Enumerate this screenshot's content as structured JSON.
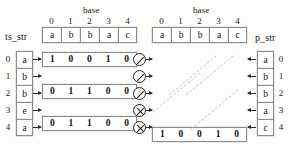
{
  "diagram": {
    "left_panel": {
      "base_label": "base",
      "base_indices": [
        "0",
        "1",
        "2",
        "3",
        "4"
      ],
      "base_letters": [
        "a",
        "b",
        "b",
        "a",
        "c"
      ],
      "string_label": "ts_str",
      "row_indices": [
        "0",
        "1",
        "2",
        "3",
        "4"
      ],
      "string_letters": [
        "a",
        "b",
        "b",
        "e",
        "a"
      ],
      "bit_rows": [
        [
          "1",
          "0",
          "0",
          "1",
          "0"
        ],
        [
          "0",
          "1",
          "1",
          "0",
          "0"
        ],
        [
          "0",
          "1",
          "1",
          "0",
          "0"
        ],
        [
          "0",
          "0",
          "0",
          "0",
          "0"
        ],
        [
          "1",
          "0",
          "0",
          "1",
          "0"
        ]
      ]
    },
    "operators": [
      {
        "name": "slash-circle",
        "glyph": "/"
      },
      {
        "name": "slash-circle",
        "glyph": "/"
      },
      {
        "name": "slash-circle",
        "glyph": "/"
      },
      {
        "name": "x-circle",
        "glyph": "X"
      },
      {
        "name": "x-circle",
        "glyph": "X"
      }
    ],
    "right_panel": {
      "base_label": "base",
      "base_indices": [
        "0",
        "1",
        "2",
        "3",
        "4"
      ],
      "base_letters": [
        "a",
        "b",
        "b",
        "a",
        "c"
      ],
      "string_label": "p_str",
      "row_indices": [
        "0",
        "1",
        "2",
        "3",
        "4"
      ],
      "string_letters": [
        "a",
        "b",
        "b",
        "a",
        "c"
      ],
      "bit_rows": [
        [
          "1",
          "0",
          "0",
          "1",
          "0"
        ],
        [
          "0",
          "1",
          "1",
          "0",
          "0"
        ],
        [
          "0",
          "1",
          "1",
          "0",
          "0"
        ],
        [
          "1",
          "0",
          "0",
          "1",
          "0"
        ],
        [
          "0",
          "0",
          "0",
          "0",
          "1"
        ]
      ]
    },
    "colors": {
      "border": "#8c8c8c",
      "text": "#111111",
      "arrow": "#2a2a2a",
      "background": "#fdfdfc",
      "diagonal": "#b9b2ae"
    }
  }
}
